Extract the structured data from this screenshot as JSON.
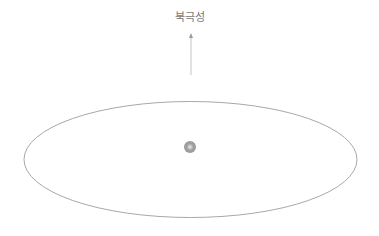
{
  "diagram": {
    "pointer_label": "북극성",
    "colors": {
      "orbit": "#9a9a9a",
      "arrow": "#bbbbbb",
      "body": "#8a8a8a",
      "label": "#777777"
    }
  }
}
